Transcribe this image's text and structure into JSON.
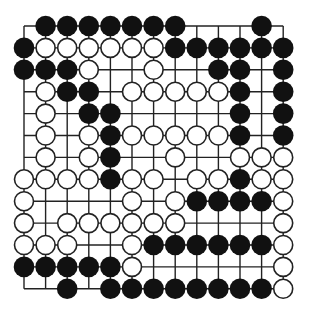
{
  "board": {
    "size": 13,
    "origin_x": 24,
    "origin_y": 26,
    "step_x": 21.6,
    "step_y": 21.9,
    "stone_radius": 10.3,
    "colors": {
      "line": "#222222",
      "black_stone": "#111111",
      "white_stone_fill": "#ffffff",
      "white_stone_stroke": "#222222",
      "background": "#ffffff"
    },
    "legend": {
      "B": "black-stone",
      "W": "white-stone",
      ".": "empty-point"
    },
    "rows": [
      ".BBBBBBB...B.",
      "BWWWWWWBBBBBB",
      "BBBW..W..BB.B",
      ".WBB.WWWWWB.B",
      ".W.BB.....B.B",
      ".W.WBWWWWWB.B",
      ".W.WB..W..WWW",
      "WWWWBWW.WWBWW",
      "W....W.WBBBBW",
      "W.WWWWWW....W",
      "WWW..WBBBBBBW",
      "BBBBBW......W",
      "..B.BBBBBBBBW"
    ]
  }
}
